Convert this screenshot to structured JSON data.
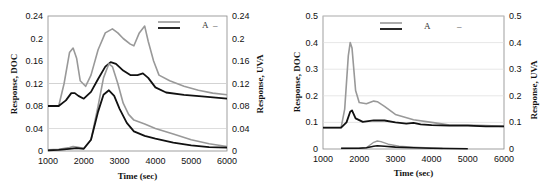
{
  "chart_data": [
    {
      "type": "line",
      "title": "",
      "xlabel": "Time (sec)",
      "ylabel": "Response, DOC",
      "ylabel_right": "Response, UVA",
      "xlim": [
        1000,
        6000
      ],
      "ylim": [
        0,
        0.24
      ],
      "xticks": [
        "1000",
        "2000",
        "3000",
        "4000",
        "5000",
        "6000"
      ],
      "yticks": [
        "0",
        "0.04",
        "0.08",
        "0.12",
        "0.16",
        "0.2",
        "0.24"
      ],
      "yticks_right": [
        "0",
        "0.04",
        "0.08",
        "0.12",
        "0.16",
        "0.2",
        "0.24"
      ],
      "grid": "horizontal",
      "legend": {
        "position": "upper right",
        "entries": [
          {
            "label": "A",
            "color": "#999999"
          },
          {
            "label": "–",
            "color": "#111111"
          }
        ]
      },
      "series": [
        {
          "name": "DOC (upper gray)",
          "color": "#999999",
          "width": 1.6,
          "x": [
            1000,
            1300,
            1450,
            1600,
            1700,
            1800,
            1900,
            2050,
            2200,
            2400,
            2600,
            2800,
            2950,
            3100,
            3300,
            3400,
            3550,
            3700,
            3800,
            3950,
            4100,
            4400,
            4800,
            5200,
            5600,
            6000
          ],
          "y": [
            0.08,
            0.08,
            0.12,
            0.175,
            0.183,
            0.165,
            0.125,
            0.115,
            0.135,
            0.18,
            0.21,
            0.217,
            0.21,
            0.2,
            0.19,
            0.187,
            0.21,
            0.222,
            0.195,
            0.16,
            0.135,
            0.125,
            0.115,
            0.108,
            0.103,
            0.1
          ]
        },
        {
          "name": "UVA (upper black)",
          "color": "#111111",
          "width": 1.8,
          "x": [
            1000,
            1300,
            1500,
            1650,
            1750,
            1850,
            2000,
            2200,
            2400,
            2600,
            2750,
            2900,
            3100,
            3300,
            3500,
            3650,
            3800,
            4000,
            4300,
            4800,
            5300,
            6000
          ],
          "y": [
            0.08,
            0.08,
            0.09,
            0.103,
            0.103,
            0.098,
            0.093,
            0.105,
            0.128,
            0.15,
            0.158,
            0.155,
            0.143,
            0.135,
            0.135,
            0.138,
            0.13,
            0.113,
            0.104,
            0.1,
            0.097,
            0.093
          ]
        },
        {
          "name": "DOC (lower gray)",
          "color": "#999999",
          "width": 1.6,
          "x": [
            1000,
            1300,
            1600,
            1700,
            1800,
            2000,
            2200,
            2400,
            2550,
            2700,
            2800,
            2950,
            3100,
            3250,
            3400,
            3700,
            4000,
            4500,
            5000,
            5500,
            6000
          ],
          "y": [
            0.002,
            0.003,
            0.006,
            0.008,
            0.007,
            0.005,
            0.02,
            0.08,
            0.13,
            0.155,
            0.15,
            0.12,
            0.085,
            0.065,
            0.055,
            0.048,
            0.04,
            0.03,
            0.02,
            0.013,
            0.008
          ]
        },
        {
          "name": "UVA (lower black)",
          "color": "#111111",
          "width": 1.8,
          "x": [
            1000,
            1300,
            1600,
            1800,
            2000,
            2200,
            2400,
            2550,
            2700,
            2850,
            3000,
            3200,
            3400,
            3700,
            4000,
            4500,
            5000,
            5500,
            6000
          ],
          "y": [
            0.001,
            0.002,
            0.004,
            0.005,
            0.004,
            0.02,
            0.07,
            0.1,
            0.108,
            0.098,
            0.075,
            0.05,
            0.035,
            0.027,
            0.022,
            0.015,
            0.01,
            0.007,
            0.006
          ]
        }
      ]
    },
    {
      "type": "line",
      "title": "",
      "xlabel": "Time (sec)",
      "ylabel": "Response, DOC",
      "ylabel_right": "Response, UVA",
      "xlim": [
        1000,
        6000
      ],
      "ylim": [
        0,
        0.5
      ],
      "xticks": [
        "1000",
        "2000",
        "3000",
        "4000",
        "5000",
        "6000"
      ],
      "yticks": [
        "0",
        "0.1",
        "0.2",
        "0.3",
        "0.4",
        "0.5"
      ],
      "yticks_right": [
        "0",
        "0.1",
        "0.2",
        "0.3",
        "0.4",
        "0.5"
      ],
      "grid": "horizontal",
      "legend": {
        "position": "upper right",
        "entries": [
          {
            "label": "A",
            "color": "#999999"
          },
          {
            "label": "–",
            "color": "#111111"
          }
        ]
      },
      "series": [
        {
          "name": "DOC (upper gray)",
          "color": "#999999",
          "width": 1.6,
          "x": [
            1000,
            1500,
            1600,
            1700,
            1750,
            1800,
            1900,
            2000,
            2200,
            2400,
            2500,
            2700,
            3000,
            3500,
            4000,
            4500,
            5000,
            5500,
            6000
          ],
          "y": [
            0.08,
            0.08,
            0.15,
            0.35,
            0.4,
            0.38,
            0.22,
            0.175,
            0.17,
            0.18,
            0.178,
            0.16,
            0.13,
            0.11,
            0.1,
            0.09,
            0.09,
            0.088,
            0.085
          ]
        },
        {
          "name": "UVA (upper black)",
          "color": "#111111",
          "width": 1.8,
          "x": [
            1000,
            1500,
            1650,
            1750,
            1800,
            1900,
            2100,
            2400,
            2700,
            3000,
            3300,
            3500,
            3700,
            4000,
            4500,
            5000,
            5500,
            6000
          ],
          "y": [
            0.08,
            0.08,
            0.1,
            0.14,
            0.145,
            0.115,
            0.102,
            0.108,
            0.107,
            0.1,
            0.095,
            0.098,
            0.093,
            0.09,
            0.088,
            0.088,
            0.085,
            0.085
          ]
        },
        {
          "name": "DOC (lower gray)",
          "color": "#999999",
          "width": 1.4,
          "x": [
            1500,
            2000,
            2200,
            2400,
            2500,
            2600,
            2800,
            3100,
            3500,
            4000,
            4300
          ],
          "y": [
            0.002,
            0.003,
            0.005,
            0.025,
            0.03,
            0.028,
            0.018,
            0.01,
            0.007,
            0.004,
            0.002
          ]
        },
        {
          "name": "UVA (lower black)",
          "color": "#111111",
          "width": 1.6,
          "x": [
            1500,
            2000,
            2200,
            2400,
            2500,
            2700,
            3000,
            3500,
            4000,
            4500,
            5000
          ],
          "y": [
            0.003,
            0.003,
            0.005,
            0.01,
            0.012,
            0.01,
            0.007,
            0.005,
            0.003,
            0.002,
            0.001
          ]
        }
      ]
    }
  ]
}
